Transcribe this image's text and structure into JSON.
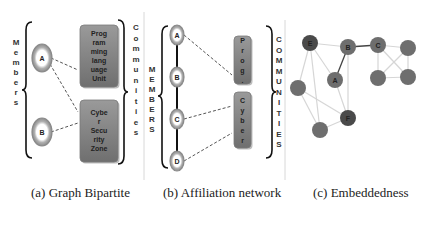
{
  "panels": {
    "a": {
      "caption": "(a) Graph Bipartite",
      "members_label": "Members",
      "communities_label": "Communities",
      "members": [
        {
          "id": "A"
        },
        {
          "id": "B"
        }
      ],
      "communities": [
        {
          "lines": [
            "Prog",
            "ram",
            "ming",
            "lang",
            "uage",
            "Unit"
          ]
        },
        {
          "lines": [
            "Cybe",
            "r",
            "Secu",
            "rity",
            "Zone"
          ]
        }
      ],
      "links": [
        [
          "A",
          0
        ],
        [
          "A",
          1
        ],
        [
          "B",
          1
        ]
      ]
    },
    "b": {
      "caption": "(b) Affiliation network",
      "members_label": "MEMBERS",
      "communities_label": "COMMUNITIES",
      "members": [
        {
          "id": "A"
        },
        {
          "id": "B"
        },
        {
          "id": "C"
        },
        {
          "id": "D"
        }
      ],
      "communities": [
        {
          "lines": [
            "P",
            "r",
            "o",
            "g",
            "."
          ]
        },
        {
          "lines": [
            "C",
            "y",
            "b",
            "e",
            "r"
          ]
        }
      ],
      "chain": [
        "A",
        "B",
        "C",
        "D"
      ],
      "links": [
        [
          "A",
          0
        ],
        [
          "C",
          1
        ],
        [
          "D",
          1
        ]
      ]
    },
    "c": {
      "caption": "(c) Embeddedness",
      "nodes": [
        {
          "id": "E",
          "label": "E",
          "shade": "dark"
        },
        {
          "id": "B",
          "label": "B",
          "shade": "mid"
        },
        {
          "id": "C",
          "label": "C",
          "shade": "mid"
        },
        {
          "id": "N1",
          "label": "",
          "shade": "mid"
        },
        {
          "id": "A",
          "label": "A",
          "shade": "mid"
        },
        {
          "id": "N2",
          "label": "",
          "shade": "mid"
        },
        {
          "id": "N3",
          "label": "",
          "shade": "mid"
        },
        {
          "id": "N4",
          "label": "",
          "shade": "mid"
        },
        {
          "id": "F",
          "label": "F",
          "shade": "dark"
        },
        {
          "id": "N5",
          "label": "",
          "shade": "mid"
        }
      ],
      "edges": [
        {
          "from": "E",
          "to": "B",
          "strong": false
        },
        {
          "from": "B",
          "to": "C",
          "strong": true
        },
        {
          "from": "B",
          "to": "A",
          "strong": true
        },
        {
          "from": "E",
          "to": "A",
          "strong": false
        },
        {
          "from": "E",
          "to": "N2",
          "strong": false
        },
        {
          "from": "E",
          "to": "N5",
          "strong": false
        },
        {
          "from": "A",
          "to": "F",
          "strong": false
        },
        {
          "from": "B",
          "to": "F",
          "strong": false
        },
        {
          "from": "N2",
          "to": "F",
          "strong": false
        },
        {
          "from": "N2",
          "to": "N5",
          "strong": false
        },
        {
          "from": "N5",
          "to": "F",
          "strong": false
        },
        {
          "from": "C",
          "to": "N1",
          "strong": false
        },
        {
          "from": "C",
          "to": "N3",
          "strong": false
        },
        {
          "from": "C",
          "to": "N4",
          "strong": false
        },
        {
          "from": "N1",
          "to": "N3",
          "strong": false
        },
        {
          "from": "N1",
          "to": "N4",
          "strong": false
        },
        {
          "from": "N3",
          "to": "N4",
          "strong": false
        }
      ]
    }
  },
  "colors": {
    "box_fill": "#8a8a8a",
    "node_dark": "#4a4a4a",
    "node_mid": "#6e6e6e",
    "ring": "#9a9a9a",
    "edge_light": "#d6d6d6",
    "edge_strong": "#444444"
  }
}
